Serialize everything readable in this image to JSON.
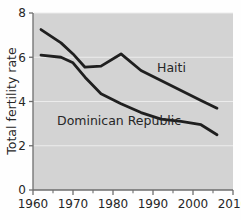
{
  "chart_data": {
    "type": "line",
    "title": "",
    "xlabel": "",
    "ylabel": "Total fertility rate",
    "xlim": [
      1960,
      2010
    ],
    "ylim": [
      0,
      8
    ],
    "xticks": [
      1960,
      1970,
      1980,
      1990,
      2000,
      2010
    ],
    "xticklabels": [
      "1960",
      "1970",
      "1980",
      "1990",
      "2000",
      "2010"
    ],
    "xminorticks": [
      1965,
      1975,
      1985,
      1995,
      2005
    ],
    "yticks": [
      0,
      2,
      4,
      6,
      8
    ],
    "yticklabels": [
      "0",
      "2",
      "4",
      "6",
      "8"
    ],
    "grid": "horizontal-light",
    "legend": "inline-annotations",
    "plot_background": "#d3d3d3",
    "line_color": "#1f1f1f",
    "series": [
      {
        "name": "Haiti",
        "label": "Haiti",
        "label_x": 1991,
        "label_y": 5.35,
        "x": [
          1962,
          1967,
          1970,
          1973,
          1977,
          1982,
          1987,
          1992,
          1997,
          2002,
          2006
        ],
        "values": [
          7.25,
          6.65,
          6.15,
          5.55,
          5.6,
          6.15,
          5.4,
          4.95,
          4.5,
          4.05,
          3.7
        ]
      },
      {
        "name": "Dominican Republic",
        "label": "Dominican Republic",
        "label_x": 1966,
        "label_y": 2.95,
        "x": [
          1962,
          1967,
          1970,
          1973,
          1977,
          1982,
          1987,
          1992,
          1997,
          2002,
          2006
        ],
        "values": [
          6.1,
          6.0,
          5.75,
          5.1,
          4.35,
          3.9,
          3.5,
          3.2,
          3.1,
          2.95,
          2.5
        ]
      }
    ]
  },
  "axis": {
    "y_label": "Total fertility rate"
  }
}
